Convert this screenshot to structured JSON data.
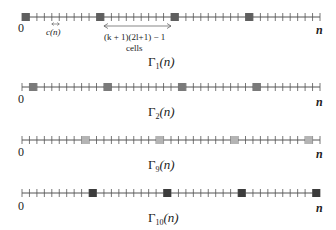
{
  "diagram": {
    "cell_width_px": 7.45,
    "total_cells": 40,
    "period_cells": 10,
    "line_x_start": 22,
    "line_x_end": 320,
    "lines": [
      {
        "id": "gamma-1",
        "label_greek": "Γ",
        "label_sub": "1",
        "label_arg": "(n)",
        "y": 17,
        "offset": 0,
        "square_color": "#5f5f5f",
        "start_label": "0",
        "end_label": "n"
      },
      {
        "id": "gamma-2",
        "label_greek": "Γ",
        "label_sub": "2",
        "label_arg": "(n)",
        "y": 87,
        "offset": 1,
        "square_color": "#7a7a7a",
        "start_label": "0",
        "end_label": "n"
      },
      {
        "id": "gamma-9",
        "label_greek": "Γ",
        "label_sub": "9",
        "label_arg": "(n)",
        "y": 140,
        "offset": 8,
        "square_color": "#b4b4b4",
        "start_label": "0",
        "end_label": "n"
      },
      {
        "id": "gamma-10",
        "label_greek": "Γ",
        "label_sub": "10",
        "label_arg": "(n)",
        "y": 193,
        "offset": 9,
        "square_color": "#3c3c3c",
        "start_label": "0",
        "end_label": "n"
      }
    ],
    "annotations": {
      "cell_width_label": "c(n)",
      "span_label_line1": "(k + 1)(2l+1) − 1",
      "span_label_line2": "cells"
    }
  }
}
